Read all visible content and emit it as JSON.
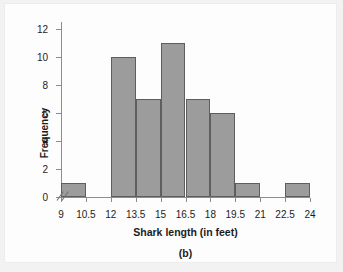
{
  "chart_data": {
    "type": "bar",
    "title": "",
    "xlabel": "Shark length (in feet)",
    "ylabel": "Frequency",
    "caption": "(b)",
    "bin_width": 1.5,
    "bin_edges": [
      9,
      10.5,
      12,
      13.5,
      15,
      16.5,
      18,
      19.5,
      21,
      22.5,
      24
    ],
    "categories": [
      "9-10.5",
      "10.5-12",
      "12-13.5",
      "13.5-15",
      "15-16.5",
      "16.5-18",
      "18-19.5",
      "19.5-21",
      "21-22.5",
      "22.5-24"
    ],
    "values": [
      1,
      0,
      10,
      7,
      11,
      7,
      6,
      1,
      0,
      1
    ],
    "bars": [
      {
        "label": "9-10.5",
        "start": 9,
        "end": 10.5,
        "value": 1
      },
      {
        "label": "10.5-12",
        "start": 10.5,
        "end": 12,
        "value": 0
      },
      {
        "label": "12-13.5",
        "start": 12,
        "end": 13.5,
        "value": 10
      },
      {
        "label": "13.5-15",
        "start": 13.5,
        "end": 15,
        "value": 7
      },
      {
        "label": "15-16.5",
        "start": 15,
        "end": 16.5,
        "value": 11
      },
      {
        "label": "16.5-18",
        "start": 16.5,
        "end": 18,
        "value": 7
      },
      {
        "label": "18-19.5",
        "start": 18,
        "end": 19.5,
        "value": 6
      },
      {
        "label": "19.5-21",
        "start": 19.5,
        "end": 21,
        "value": 1
      },
      {
        "label": "21-22.5",
        "start": 21,
        "end": 22.5,
        "value": 0
      },
      {
        "label": "22.5-24",
        "start": 22.5,
        "end": 24,
        "value": 1
      }
    ],
    "xlim": [
      9,
      24
    ],
    "ylim": [
      0,
      12.6
    ],
    "xticks": [
      "9",
      "10.5",
      "12",
      "13.5",
      "15",
      "16.5",
      "18",
      "19.5",
      "21",
      "22.5",
      "24"
    ],
    "xtick_values": [
      9,
      10.5,
      12,
      13.5,
      15,
      16.5,
      18,
      19.5,
      21,
      22.5,
      24
    ],
    "yticks": [
      "0",
      "2",
      "4",
      "6",
      "8",
      "10",
      "12"
    ],
    "ytick_values": [
      0,
      2,
      4,
      6,
      8,
      10,
      12
    ],
    "grid": false,
    "legend": false,
    "axis_break": "//",
    "colors": {
      "bar_fill": "#9c9c9c",
      "bar_border": "#5e5e5e",
      "axis": "#8c8c8c",
      "text": "#1c1c1c",
      "plot_background": "#fdfdfd",
      "page_background": "#f2f2f2"
    }
  }
}
